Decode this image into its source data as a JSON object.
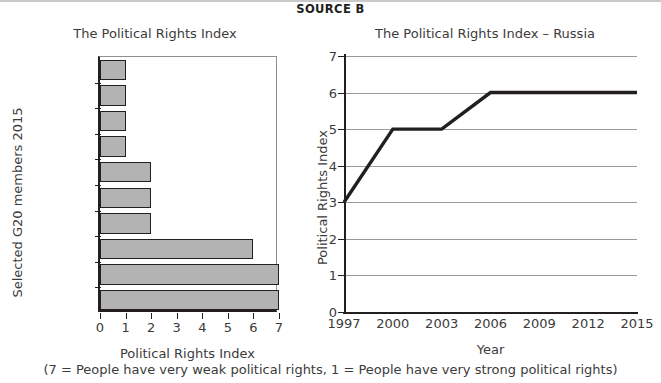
{
  "header": {
    "source_label": "SOURCE B"
  },
  "caption": "(7 = People have very weak political rights,  1 = People have very strong political rights)",
  "chart_data": [
    {
      "type": "bar",
      "orientation": "horizontal",
      "title": "The Political Rights Index",
      "xlabel": "Political Rights Index",
      "ylabel": "Selected G20 members 2015",
      "categories": [
        "USA",
        "Canada",
        "UK",
        "France",
        "Argentina",
        "Brazil",
        "India",
        "Russia",
        "Saudi Arabia",
        "China"
      ],
      "values": [
        1,
        1,
        1,
        1,
        2,
        2,
        2,
        6,
        7,
        7
      ],
      "xlim": [
        0,
        7
      ],
      "xticks": [
        0,
        1,
        2,
        3,
        4,
        5,
        6,
        7
      ],
      "xticklabels": [
        "0",
        "1",
        "2",
        "3",
        "4",
        "5",
        "6",
        "7"
      ],
      "grid": false,
      "bar_fill": "#b3b3b3",
      "bar_edge": "#231f20"
    },
    {
      "type": "line",
      "title": "The Political Rights Index – Russia",
      "xlabel": "Year",
      "ylabel": "Political Rights Index",
      "x": [
        1997,
        2000,
        2003,
        2006,
        2015
      ],
      "values": [
        3,
        5,
        5,
        6,
        6
      ],
      "xlim": [
        1997,
        2015
      ],
      "ylim": [
        0,
        7
      ],
      "xticks": [
        1997,
        2000,
        2003,
        2006,
        2009,
        2012,
        2015
      ],
      "xticklabels": [
        "1997",
        "2000",
        "2003",
        "2006",
        "2009",
        "2012",
        "2015"
      ],
      "yticks": [
        0,
        1,
        2,
        3,
        4,
        5,
        6,
        7
      ],
      "yticklabels": [
        "0",
        "1",
        "2",
        "3",
        "4",
        "5",
        "6",
        "7"
      ],
      "grid": true,
      "grid_color": "#9a9a9a",
      "line_color": "#231f20"
    }
  ]
}
